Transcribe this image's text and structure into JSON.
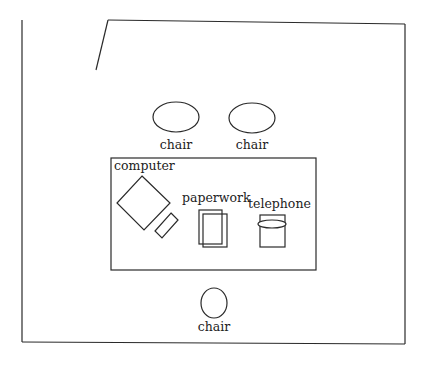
{
  "diagram": {
    "type": "office floor plan",
    "colors": {
      "line": "#2a2a2a",
      "text": "#222222",
      "background": "#ffffff"
    },
    "room": {
      "walls": "outer rectangle with an angled door opening at top-left"
    },
    "furniture": {
      "chair_top_left": {
        "label": "chair"
      },
      "chair_top_right": {
        "label": "chair"
      },
      "desk": {
        "items": {
          "computer": {
            "label": "computer"
          },
          "paperwork": {
            "label": "paperwork"
          },
          "telephone": {
            "label": "telephone"
          }
        }
      },
      "chair_bottom": {
        "label": "chair"
      }
    }
  }
}
